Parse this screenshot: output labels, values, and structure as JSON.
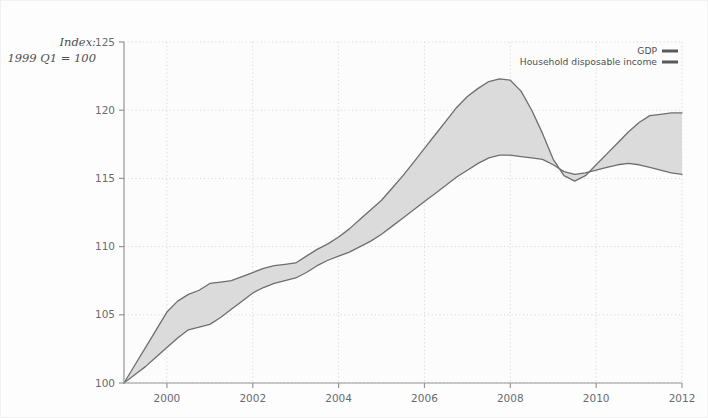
{
  "chart_data": {
    "type": "area",
    "title": "",
    "subtitle": "",
    "xlabel": "",
    "ylabel": "Index: 1999 Q1 = 100",
    "axis_note_line1": "Index:",
    "axis_note_line2": "1999 Q1 = 100",
    "ylim": [
      100,
      125
    ],
    "yticks": [
      100,
      105,
      110,
      115,
      120,
      125
    ],
    "ytick_labels": [
      "100",
      "105",
      "110",
      "115",
      "120",
      "125"
    ],
    "xlim": [
      1999.0,
      2012.0
    ],
    "xticks": [
      2000,
      2002,
      2004,
      2006,
      2008,
      2010,
      2012
    ],
    "xtick_labels": [
      "2000",
      "2002",
      "2004",
      "2006",
      "2008",
      "2010",
      "2012"
    ],
    "grid": "dotted-both",
    "legend_position": "top-right",
    "x": [
      1999.0,
      1999.25,
      1999.5,
      1999.75,
      2000.0,
      2000.25,
      2000.5,
      2000.75,
      2001.0,
      2001.25,
      2001.5,
      2001.75,
      2002.0,
      2002.25,
      2002.5,
      2002.75,
      2003.0,
      2003.25,
      2003.5,
      2003.75,
      2004.0,
      2004.25,
      2004.5,
      2004.75,
      2005.0,
      2005.25,
      2005.5,
      2005.75,
      2006.0,
      2006.25,
      2006.5,
      2006.75,
      2007.0,
      2007.25,
      2007.5,
      2007.75,
      2008.0,
      2008.25,
      2008.5,
      2008.75,
      2009.0,
      2009.25,
      2009.5,
      2009.75,
      2010.0,
      2010.25,
      2010.5,
      2010.75,
      2011.0,
      2011.25,
      2011.5,
      2011.75,
      2012.0
    ],
    "series": [
      {
        "name": "GDP",
        "color": "#6d6e70",
        "values": [
          100.0,
          100.6,
          101.2,
          101.9,
          102.6,
          103.3,
          103.9,
          104.1,
          104.3,
          104.8,
          105.4,
          106.0,
          106.6,
          107.0,
          107.3,
          107.5,
          107.7,
          108.1,
          108.6,
          109.0,
          109.3,
          109.6,
          110.0,
          110.4,
          110.9,
          111.5,
          112.1,
          112.7,
          113.3,
          113.9,
          114.5,
          115.1,
          115.6,
          116.1,
          116.5,
          116.7,
          116.7,
          116.6,
          116.5,
          116.4,
          116.0,
          115.5,
          115.3,
          115.4,
          115.6,
          115.8,
          116.0,
          116.1,
          116.0,
          115.8,
          115.6,
          115.4,
          115.3
        ]
      },
      {
        "name": "Household disposable income",
        "color": "#6d6e70",
        "values": [
          100.0,
          101.3,
          102.6,
          103.9,
          105.2,
          106.0,
          106.5,
          106.8,
          107.3,
          107.4,
          107.5,
          107.8,
          108.1,
          108.4,
          108.6,
          108.7,
          108.8,
          109.3,
          109.8,
          110.2,
          110.7,
          111.3,
          112.0,
          112.7,
          113.4,
          114.3,
          115.2,
          116.2,
          117.2,
          118.2,
          119.2,
          120.2,
          121.0,
          121.6,
          122.1,
          122.3,
          122.2,
          121.4,
          120.0,
          118.3,
          116.4,
          115.2,
          114.8,
          115.2,
          116.0,
          116.8,
          117.6,
          118.4,
          119.1,
          119.6,
          119.7,
          119.8,
          119.8
        ]
      }
    ],
    "band_fill_color": "#d9d9d9",
    "legend": [
      {
        "label": "GDP",
        "swatch_color": "#58595b"
      },
      {
        "label": "Household disposable income",
        "swatch_color": "#58595b"
      }
    ]
  }
}
